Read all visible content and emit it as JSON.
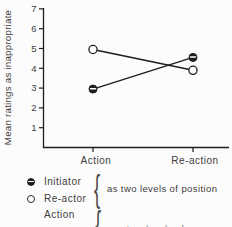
{
  "chart_data": {
    "type": "line",
    "categories": [
      "Action",
      "Re-action"
    ],
    "series": [
      {
        "name": "Initiator",
        "marker": "half-filled-circle",
        "values": [
          2.95,
          4.55
        ]
      },
      {
        "name": "Re-actor",
        "marker": "open-circle",
        "values": [
          4.95,
          3.9
        ]
      }
    ],
    "title": "",
    "xlabel": "",
    "ylabel": "Mean ratings as inappropriate",
    "ylim": [
      0,
      7
    ],
    "y_ticks": [
      1,
      2,
      3,
      4,
      5,
      6,
      7
    ],
    "grid": false,
    "legend_position": "below-left"
  },
  "legend": {
    "items": [
      {
        "marker": "half-filled-circle",
        "label": "Initiator"
      },
      {
        "marker": "open-circle",
        "label": "Re-actor"
      }
    ],
    "brace": "{",
    "note": "as two levels of position"
  },
  "bottom_legend": {
    "label": "Action",
    "brace": "{",
    "clipped_note": "as two levels of"
  },
  "colors": {
    "ink": "#1e1e1e",
    "text": "#3d3d3d",
    "background": "#fcfcfc"
  }
}
